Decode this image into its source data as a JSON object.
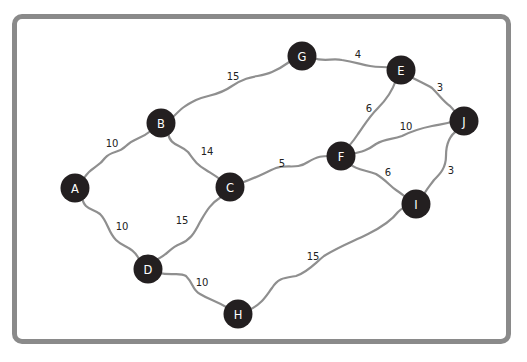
{
  "diagram": {
    "type": "weighted-undirected-graph",
    "colors": {
      "frame_border": "#8a8a8a",
      "edge": "#8f8f8f",
      "node_fill": "#231f20",
      "node_text": "#ffffff",
      "label_text": "#222222"
    },
    "nodes": [
      {
        "id": "A",
        "label": "A",
        "x": 75,
        "y": 188
      },
      {
        "id": "B",
        "label": "B",
        "x": 161,
        "y": 123
      },
      {
        "id": "C",
        "label": "C",
        "x": 230,
        "y": 187
      },
      {
        "id": "D",
        "label": "D",
        "x": 148,
        "y": 269
      },
      {
        "id": "E",
        "label": "E",
        "x": 401,
        "y": 70
      },
      {
        "id": "F",
        "label": "F",
        "x": 341,
        "y": 156
      },
      {
        "id": "G",
        "label": "G",
        "x": 302,
        "y": 56
      },
      {
        "id": "H",
        "label": "H",
        "x": 238,
        "y": 314
      },
      {
        "id": "I",
        "label": "I",
        "x": 416,
        "y": 204
      },
      {
        "id": "J",
        "label": "J",
        "x": 464,
        "y": 121
      }
    ],
    "edges": [
      {
        "from": "A",
        "to": "B",
        "weight": "10",
        "lx": 112,
        "ly": 144
      },
      {
        "from": "A",
        "to": "D",
        "weight": "10",
        "lx": 122,
        "ly": 227
      },
      {
        "from": "B",
        "to": "G",
        "weight": "15",
        "lx": 233,
        "ly": 77
      },
      {
        "from": "B",
        "to": "C",
        "weight": "14",
        "lx": 207,
        "ly": 152
      },
      {
        "from": "C",
        "to": "D",
        "weight": "15",
        "lx": 182,
        "ly": 221
      },
      {
        "from": "C",
        "to": "F",
        "weight": "5",
        "lx": 282,
        "ly": 164
      },
      {
        "from": "D",
        "to": "H",
        "weight": "10",
        "lx": 202,
        "ly": 283
      },
      {
        "from": "G",
        "to": "E",
        "weight": "4",
        "lx": 358,
        "ly": 55
      },
      {
        "from": "E",
        "to": "J",
        "weight": "3",
        "lx": 440,
        "ly": 88
      },
      {
        "from": "E",
        "to": "F",
        "weight": "6",
        "lx": 369,
        "ly": 109
      },
      {
        "from": "F",
        "to": "J",
        "weight": "10",
        "lx": 406,
        "ly": 127
      },
      {
        "from": "F",
        "to": "I",
        "weight": "6",
        "lx": 388,
        "ly": 173
      },
      {
        "from": "J",
        "to": "I",
        "weight": "3",
        "lx": 451,
        "ly": 171
      },
      {
        "from": "H",
        "to": "I",
        "weight": "15",
        "lx": 313,
        "ly": 257
      }
    ]
  }
}
